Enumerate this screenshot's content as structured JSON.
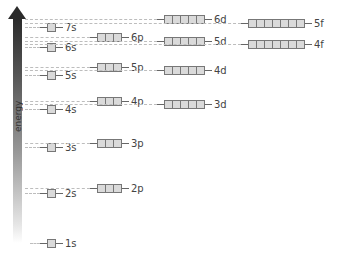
{
  "axis": {
    "label": "energy"
  },
  "colors": {
    "arrow_top": "#2b2b2b",
    "box_fill": "#d9d9d9",
    "box_border": "#777777",
    "dash": "#bdbdbd"
  },
  "levels": [
    {
      "label": "1s",
      "boxes": 1,
      "x": 40,
      "y": 239,
      "dash_from": 30
    },
    {
      "label": "2s",
      "boxes": 1,
      "x": 40,
      "y": 189,
      "dash_from": 25
    },
    {
      "label": "2p",
      "boxes": 3,
      "x": 90,
      "y": 184,
      "dash_from": 25
    },
    {
      "label": "3s",
      "boxes": 1,
      "x": 40,
      "y": 143,
      "dash_from": 25
    },
    {
      "label": "3p",
      "boxes": 3,
      "x": 90,
      "y": 139,
      "dash_from": 25
    },
    {
      "label": "4s",
      "boxes": 1,
      "x": 40,
      "y": 105,
      "dash_from": 25
    },
    {
      "label": "4p",
      "boxes": 3,
      "x": 90,
      "y": 97,
      "dash_from": 25
    },
    {
      "label": "3d",
      "boxes": 5,
      "x": 157,
      "y": 100,
      "dash_from": 25
    },
    {
      "label": "5s",
      "boxes": 1,
      "x": 40,
      "y": 71,
      "dash_from": 25
    },
    {
      "label": "5p",
      "boxes": 3,
      "x": 90,
      "y": 63,
      "dash_from": 25
    },
    {
      "label": "4d",
      "boxes": 5,
      "x": 157,
      "y": 66,
      "dash_from": 25
    },
    {
      "label": "6s",
      "boxes": 1,
      "x": 40,
      "y": 43,
      "dash_from": 25
    },
    {
      "label": "6p",
      "boxes": 3,
      "x": 90,
      "y": 33,
      "dash_from": 25
    },
    {
      "label": "5d",
      "boxes": 5,
      "x": 157,
      "y": 37,
      "dash_from": 25
    },
    {
      "label": "4f",
      "boxes": 7,
      "x": 241,
      "y": 40,
      "dash_from": 25
    },
    {
      "label": "7s",
      "boxes": 1,
      "x": 40,
      "y": 23,
      "dash_from": 25
    },
    {
      "label": "6d",
      "boxes": 5,
      "x": 157,
      "y": 15,
      "dash_from": 25
    },
    {
      "label": "5f",
      "boxes": 7,
      "x": 241,
      "y": 19,
      "dash_from": 25
    }
  ]
}
